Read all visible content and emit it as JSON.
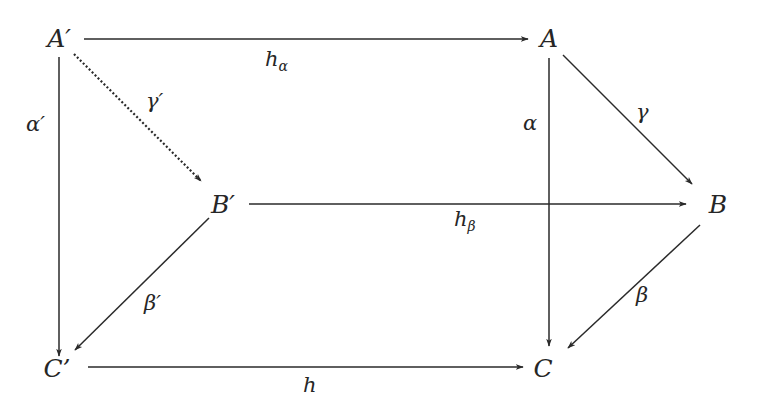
{
  "diagram": {
    "type": "commutative-diagram",
    "colors": {
      "ink": "#2a2a2a",
      "background": "#ffffff"
    },
    "nodes": {
      "A_prime": {
        "label": "A′",
        "x": 59,
        "y": 47
      },
      "A": {
        "label": "A",
        "x": 549,
        "y": 47
      },
      "B_prime": {
        "label": "B′",
        "x": 222,
        "y": 213
      },
      "B": {
        "label": "B",
        "x": 718,
        "y": 213
      },
      "C_prime": {
        "label": "C’",
        "x": 57,
        "y": 377
      },
      "C": {
        "label": "C",
        "x": 543,
        "y": 377
      }
    },
    "edges": {
      "h_alpha": {
        "from": "A′",
        "to": "A",
        "base": "h",
        "sub": "α",
        "style": "solid"
      },
      "gamma_prime": {
        "from": "A′",
        "to": "B′",
        "label": "γ′",
        "style": "dotted"
      },
      "alpha_prime": {
        "from": "A′",
        "to": "C’",
        "label": "α′",
        "style": "solid"
      },
      "gamma": {
        "from": "A",
        "to": "B",
        "label": "γ",
        "style": "solid"
      },
      "alpha": {
        "from": "A",
        "to": "C",
        "label": "α",
        "style": "solid"
      },
      "h_beta": {
        "from": "B′",
        "to": "B",
        "base": "h",
        "sub": "β",
        "style": "solid"
      },
      "beta_prime": {
        "from": "B′",
        "to": "C’",
        "label": "β′",
        "style": "solid"
      },
      "beta": {
        "from": "B",
        "to": "C",
        "label": "β",
        "style": "solid"
      },
      "h": {
        "from": "C’",
        "to": "C",
        "label": "h",
        "style": "solid"
      }
    }
  }
}
